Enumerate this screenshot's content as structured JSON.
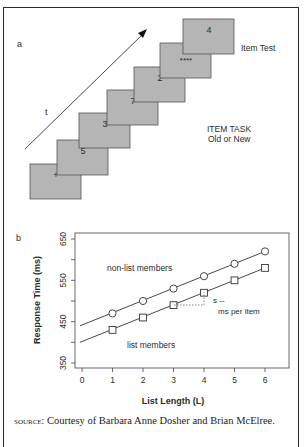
{
  "panel_a": {
    "label": "a",
    "time_label": "t",
    "test_label": "Item Test",
    "task_title": "ITEM TASK",
    "task_subtitle": "Old or New",
    "frames": [
      {
        "text": "+",
        "x": 30,
        "y": 164
      },
      {
        "text": "5",
        "x": 57,
        "y": 140
      },
      {
        "text": "3",
        "x": 79,
        "y": 113
      },
      {
        "text": "7",
        "x": 107,
        "y": 90
      },
      {
        "text": "2",
        "x": 134,
        "y": 67
      },
      {
        "text": "****",
        "x": 160,
        "y": 43
      },
      {
        "text": "4",
        "x": 183,
        "y": 19
      }
    ],
    "frame_fill": "#b5b5b5",
    "frame_stroke": "#555555"
  },
  "panel_b": {
    "label": "b",
    "annotation_slope": "s --",
    "annotation_unit": "ms per item",
    "series_labels": {
      "nonlist": "non-list members",
      "list": "list members"
    }
  },
  "caption": {
    "source_label": "source:",
    "text": " Courtesy of Barbara Anne Dosher and Brian McElree."
  },
  "chart_data": {
    "type": "line",
    "title": "",
    "xlabel": "List Length (L)",
    "ylabel": "Response Time (ms)",
    "x": [
      1,
      2,
      3,
      4,
      5,
      6
    ],
    "x_ticks": [
      0,
      1,
      2,
      3,
      4,
      5,
      6
    ],
    "y_ticks": [
      350,
      400,
      450,
      500,
      550,
      600,
      650
    ],
    "y_tick_labels": [
      "350",
      "450",
      "550",
      "650"
    ],
    "xlim": [
      0,
      6
    ],
    "ylim": [
      350,
      650
    ],
    "grid": false,
    "legend": "inline text labels",
    "series": [
      {
        "name": "non-list members",
        "marker": "circle",
        "values": [
          470,
          500,
          530,
          560,
          590,
          620
        ],
        "fit_intercept": 440,
        "fit_slope": 30
      },
      {
        "name": "list members",
        "marker": "square",
        "values": [
          430,
          460,
          490,
          520,
          550,
          580
        ],
        "fit_intercept": 400,
        "fit_slope": 30
      }
    ],
    "annotations": [
      "s -- ms per item"
    ]
  }
}
